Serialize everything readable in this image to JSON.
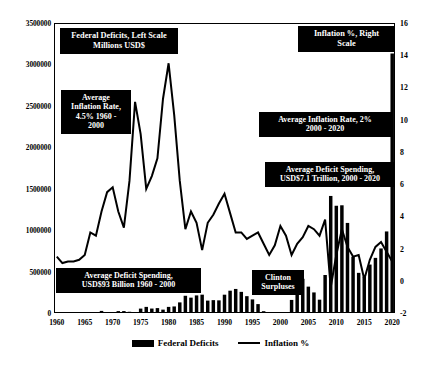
{
  "chart_data": {
    "type": "bar",
    "title": "",
    "xlabel": "",
    "ylabel": "",
    "grid": false,
    "legend_position": "bottom",
    "x": [
      1960,
      1961,
      1962,
      1963,
      1964,
      1965,
      1966,
      1967,
      1968,
      1969,
      1970,
      1971,
      1972,
      1973,
      1974,
      1975,
      1976,
      1977,
      1978,
      1979,
      1980,
      1981,
      1982,
      1983,
      1984,
      1985,
      1986,
      1987,
      1988,
      1989,
      1990,
      1991,
      1992,
      1993,
      1994,
      1995,
      1996,
      1997,
      1998,
      1999,
      2000,
      2001,
      2002,
      2003,
      2004,
      2005,
      2006,
      2007,
      2008,
      2009,
      2010,
      2011,
      2012,
      2013,
      2014,
      2015,
      2016,
      2017,
      2018,
      2019,
      2020
    ],
    "xtick_labels": [
      "1960",
      "1965",
      "1970",
      "1975",
      "1980",
      "1985",
      "1990",
      "1995",
      "2000",
      "2005",
      "2010",
      "2015",
      "2020"
    ],
    "left_axis": {
      "label": "Federal Deficits, Left Scale Millions USD$",
      "ticks": [
        0,
        500000,
        1000000,
        1500000,
        2000000,
        2500000,
        3000000,
        3500000
      ],
      "tick_labels": [
        "0",
        "500000",
        "1000000",
        "1500000",
        "2000000",
        "2500000",
        "3000000",
        "3500000"
      ],
      "ylim": [
        0,
        3500000
      ]
    },
    "right_axis": {
      "label": "Inflation %, Right Scale",
      "ticks": [
        -2,
        0,
        2,
        4,
        6,
        8,
        10,
        12,
        14,
        16
      ],
      "tick_labels": [
        "-2",
        "0",
        "2",
        "4",
        "6",
        "8",
        "10",
        "12",
        "14",
        "16"
      ],
      "ylim": [
        -2,
        16
      ]
    },
    "series": [
      {
        "name": "Federal Deficits",
        "type": "bar",
        "axis": "left",
        "color": "#000000",
        "values": [
          0,
          3300,
          7100,
          4800,
          5900,
          1400,
          3700,
          8600,
          25200,
          0,
          2800,
          23000,
          23400,
          14900,
          6100,
          53200,
          73700,
          53700,
          59200,
          40700,
          73800,
          79000,
          128000,
          207800,
          185400,
          212300,
          221200,
          149700,
          155200,
          152600,
          221000,
          269200,
          290300,
          255100,
          203200,
          164000,
          107400,
          21900,
          0,
          0,
          0,
          0,
          157800,
          377600,
          412700,
          318300,
          248200,
          160700,
          458600,
          1412700,
          1294400,
          1300000,
          1087000,
          679500,
          484600,
          438400,
          584700,
          665400,
          779100,
          984400,
          3132000
        ]
      },
      {
        "name": "Inflation %",
        "type": "line",
        "axis": "right",
        "color": "#000000",
        "values": [
          1.5,
          1.1,
          1.2,
          1.2,
          1.3,
          1.6,
          3.0,
          2.8,
          4.3,
          5.5,
          5.8,
          4.3,
          3.3,
          6.2,
          11.1,
          9.1,
          5.7,
          6.5,
          7.6,
          11.3,
          13.5,
          10.3,
          6.2,
          3.2,
          4.3,
          3.6,
          1.9,
          3.6,
          4.1,
          4.8,
          5.4,
          4.2,
          3.0,
          3.0,
          2.6,
          2.8,
          3.0,
          2.3,
          1.6,
          2.2,
          3.4,
          2.8,
          1.6,
          2.3,
          2.7,
          3.4,
          3.2,
          2.8,
          3.8,
          -0.4,
          1.6,
          3.2,
          2.1,
          1.5,
          1.6,
          0.1,
          1.3,
          2.1,
          2.4,
          1.8,
          1.2
        ]
      }
    ],
    "annotations": [
      {
        "id": "deficits-left-scale",
        "text": "Federal Deficits, Left Scale\nMillions USD$"
      },
      {
        "id": "inflation-right-scale",
        "text": "Inflation %, Right\nScale"
      },
      {
        "id": "avg-inflation-1960-2000",
        "text": "Average\nInflation Rate,\n4.5% 1960 -\n2000"
      },
      {
        "id": "avg-inflation-2000-2020",
        "text": "Average Inflation Rate, 2%\n2000 - 2020"
      },
      {
        "id": "avg-deficit-2000-2020",
        "text": "Average Deficit Spending,\nUSD$7.1 Trillion, 2000 - 2020"
      },
      {
        "id": "avg-deficit-1960-2000",
        "text": "Average Deficit Spending,\nUSD$93 Billion 1960 - 2000"
      },
      {
        "id": "clinton-surpluses",
        "text": "Clinton\nSurpluses"
      }
    ],
    "legend": [
      {
        "id": "federal-deficits",
        "label": "Federal Deficits",
        "marker": "bar"
      },
      {
        "id": "inflation-pct",
        "label": "Inflation %",
        "marker": "line"
      }
    ]
  }
}
